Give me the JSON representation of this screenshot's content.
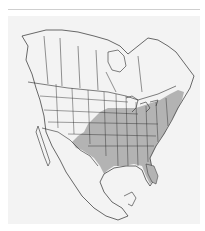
{
  "map": {
    "region": "North America",
    "legend": [
      {
        "label": "range",
        "color": "#b3b3b3"
      }
    ],
    "colors": {
      "background": "#f3f3f3",
      "range_fill": "#b3b3b3",
      "outline": "#2b2b2b",
      "rule": "#cfcfcf"
    }
  }
}
